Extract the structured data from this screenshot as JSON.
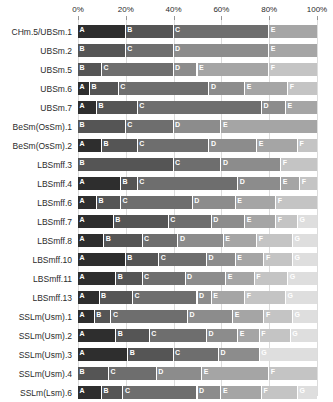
{
  "chart_data": {
    "type": "bar",
    "orientation": "horizontal",
    "stacked": true,
    "normalized_percent": true,
    "title": "",
    "xlabel": "",
    "ylabel": "",
    "xlim": [
      0,
      100
    ],
    "grid": true,
    "legend": "none",
    "axis_position": "top",
    "tick_labels": [
      "0%",
      "20%",
      "40%",
      "60%",
      "80%",
      "100%"
    ],
    "tick_values": [
      0,
      20,
      40,
      60,
      80,
      100
    ],
    "segment_keys": [
      "A",
      "B",
      "C",
      "D",
      "E",
      "F",
      "G"
    ],
    "segment_colors": {
      "A": "#2e2e2e",
      "B": "#555555",
      "C": "#6e6e6e",
      "D": "#8c8c8c",
      "E": "#a5a5a5",
      "F": "#c4c4c4",
      "G": "#dedede"
    },
    "segment_text_colors": {
      "A": "#ffffff",
      "B": "#ffffff",
      "C": "#ffffff",
      "D": "#ffffff",
      "E": "#ffffff",
      "F": "#ffffff",
      "G": "#ffffff"
    },
    "categories": [
      "CHm.5/UBSm.1",
      "UBSm.2",
      "UBSm.5",
      "UBSm.6",
      "UBSm.7",
      "BeSm(OsSm).1",
      "BeSm(OsSm).2",
      "LBSmff.3",
      "LBSmff.4",
      "LBSmff.6",
      "LBSmff.7",
      "LBSmff.8",
      "LBSmff.10",
      "LBSmff.11",
      "LBSmff.13",
      "SSLm(Usm).1",
      "SSLm(Usm).2",
      "SSLm(Usm).3",
      "SSLm(Usm).4",
      "SSLm(Lsm).6"
    ],
    "rows": [
      {
        "label": "CHm.5/UBSm.1",
        "segments": [
          {
            "key": "A",
            "value": 20.0
          },
          {
            "key": "B",
            "value": 20.0
          },
          {
            "key": "C",
            "value": 40.0
          },
          {
            "key": "E",
            "value": 20.0
          }
        ]
      },
      {
        "label": "UBSm.2",
        "segments": [
          {
            "key": "B",
            "value": 20.0
          },
          {
            "key": "C",
            "value": 20.0
          },
          {
            "key": "D",
            "value": 40.0
          },
          {
            "key": "E",
            "value": 20.0
          }
        ]
      },
      {
        "label": "UBSm.5",
        "segments": [
          {
            "key": "B",
            "value": 10.0
          },
          {
            "key": "C",
            "value": 30.0
          },
          {
            "key": "D",
            "value": 10.0
          },
          {
            "key": "E",
            "value": 30.0
          },
          {
            "key": "F",
            "value": 20.0
          }
        ]
      },
      {
        "label": "UBSm.6",
        "segments": [
          {
            "key": "A",
            "value": 5.0
          },
          {
            "key": "B",
            "value": 12.0
          },
          {
            "key": "C",
            "value": 38.0
          },
          {
            "key": "D",
            "value": 15.0
          },
          {
            "key": "E",
            "value": 18.0
          },
          {
            "key": "F",
            "value": 12.0
          }
        ]
      },
      {
        "label": "UBSm.7",
        "segments": [
          {
            "key": "A",
            "value": 8.0
          },
          {
            "key": "B",
            "value": 17.0
          },
          {
            "key": "C",
            "value": 52.0
          },
          {
            "key": "D",
            "value": 10.0
          },
          {
            "key": "E",
            "value": 13.0
          }
        ]
      },
      {
        "label": "BeSm(OsSm).1",
        "segments": [
          {
            "key": "B",
            "value": 20.0
          },
          {
            "key": "C",
            "value": 20.0
          },
          {
            "key": "D",
            "value": 20.0
          },
          {
            "key": "E",
            "value": 40.0
          }
        ]
      },
      {
        "label": "BeSm(OsSm).2",
        "segments": [
          {
            "key": "A",
            "value": 10.0
          },
          {
            "key": "B",
            "value": 15.0
          },
          {
            "key": "C",
            "value": 30.0
          },
          {
            "key": "D",
            "value": 20.0
          },
          {
            "key": "E",
            "value": 17.0
          },
          {
            "key": "F",
            "value": 8.0
          }
        ]
      },
      {
        "label": "LBSmff.3",
        "segments": [
          {
            "key": "B",
            "value": 40.0
          },
          {
            "key": "C",
            "value": 20.0
          },
          {
            "key": "D",
            "value": 25.0
          },
          {
            "key": "F",
            "value": 15.0
          }
        ]
      },
      {
        "label": "LBSmff.4",
        "segments": [
          {
            "key": "A",
            "value": 18.0
          },
          {
            "key": "B",
            "value": 7.0
          },
          {
            "key": "C",
            "value": 42.0
          },
          {
            "key": "D",
            "value": 18.0
          },
          {
            "key": "E",
            "value": 8.0
          },
          {
            "key": "F",
            "value": 7.0
          }
        ]
      },
      {
        "label": "LBSmff.6",
        "segments": [
          {
            "key": "A",
            "value": 8.0
          },
          {
            "key": "B",
            "value": 10.0
          },
          {
            "key": "C",
            "value": 30.0
          },
          {
            "key": "D",
            "value": 18.0
          },
          {
            "key": "E",
            "value": 17.0
          },
          {
            "key": "F",
            "value": 17.0
          }
        ]
      },
      {
        "label": "LBSmff.7",
        "segments": [
          {
            "key": "A",
            "value": 15.0
          },
          {
            "key": "B",
            "value": 23.0
          },
          {
            "key": "C",
            "value": 18.0
          },
          {
            "key": "D",
            "value": 14.0
          },
          {
            "key": "E",
            "value": 13.0
          },
          {
            "key": "F",
            "value": 9.0
          },
          {
            "key": "G",
            "value": 8.0
          }
        ]
      },
      {
        "label": "LBSmff.8",
        "segments": [
          {
            "key": "A",
            "value": 11.0
          },
          {
            "key": "B",
            "value": 16.0
          },
          {
            "key": "C",
            "value": 15.0
          },
          {
            "key": "D",
            "value": 19.0
          },
          {
            "key": "E",
            "value": 14.0
          },
          {
            "key": "F",
            "value": 15.0
          },
          {
            "key": "G",
            "value": 10.0
          }
        ]
      },
      {
        "label": "LBSmff.10",
        "segments": [
          {
            "key": "A",
            "value": 20.0
          },
          {
            "key": "B",
            "value": 14.0
          },
          {
            "key": "C",
            "value": 20.0
          },
          {
            "key": "D",
            "value": 12.0
          },
          {
            "key": "E",
            "value": 12.0
          },
          {
            "key": "F",
            "value": 12.0
          },
          {
            "key": "G",
            "value": 10.0
          }
        ]
      },
      {
        "label": "LBSmff.11",
        "segments": [
          {
            "key": "A",
            "value": 16.0
          },
          {
            "key": "B",
            "value": 11.0
          },
          {
            "key": "C",
            "value": 18.0
          },
          {
            "key": "D",
            "value": 17.0
          },
          {
            "key": "E",
            "value": 12.0
          },
          {
            "key": "F",
            "value": 14.0
          },
          {
            "key": "G",
            "value": 12.0
          }
        ]
      },
      {
        "label": "LBSmff.13",
        "segments": [
          {
            "key": "A",
            "value": 9.0
          },
          {
            "key": "B",
            "value": 14.0
          },
          {
            "key": "C",
            "value": 27.0
          },
          {
            "key": "D",
            "value": 6.0
          },
          {
            "key": "E",
            "value": 14.0
          },
          {
            "key": "F",
            "value": 17.0
          },
          {
            "key": "G",
            "value": 13.0
          }
        ]
      },
      {
        "label": "SSLm(Usm).1",
        "segments": [
          {
            "key": "A",
            "value": 7.0
          },
          {
            "key": "B",
            "value": 7.0
          },
          {
            "key": "C",
            "value": 32.0
          },
          {
            "key": "D",
            "value": 19.0
          },
          {
            "key": "E",
            "value": 13.0
          },
          {
            "key": "F",
            "value": 12.0
          },
          {
            "key": "G",
            "value": 10.0
          }
        ]
      },
      {
        "label": "SSLm(Usm).2",
        "segments": [
          {
            "key": "A",
            "value": 16.0
          },
          {
            "key": "B",
            "value": 14.0
          },
          {
            "key": "C",
            "value": 24.0
          },
          {
            "key": "D",
            "value": 13.0
          },
          {
            "key": "E",
            "value": 9.0
          },
          {
            "key": "F",
            "value": 13.0
          },
          {
            "key": "G",
            "value": 11.0
          }
        ]
      },
      {
        "label": "SSLm(Usm).3",
        "segments": [
          {
            "key": "A",
            "value": 21.0
          },
          {
            "key": "B",
            "value": 19.0
          },
          {
            "key": "C",
            "value": 19.0
          },
          {
            "key": "D",
            "value": 17.0
          },
          {
            "key": "G",
            "value": 24.0
          }
        ]
      },
      {
        "label": "SSLm(Usm).4",
        "segments": [
          {
            "key": "B",
            "value": 13.0
          },
          {
            "key": "C",
            "value": 20.0
          },
          {
            "key": "D",
            "value": 19.0
          },
          {
            "key": "E",
            "value": 28.0
          },
          {
            "key": "F",
            "value": 20.0
          }
        ]
      },
      {
        "label": "SSLm(Lsm).6",
        "segments": [
          {
            "key": "A",
            "value": 10.0
          },
          {
            "key": "B",
            "value": 9.0
          },
          {
            "key": "C",
            "value": 31.0
          },
          {
            "key": "D",
            "value": 10.0
          },
          {
            "key": "E",
            "value": 17.0
          },
          {
            "key": "F",
            "value": 15.0
          },
          {
            "key": "G",
            "value": 8.0
          }
        ]
      }
    ]
  }
}
